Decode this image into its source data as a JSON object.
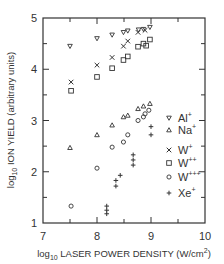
{
  "chart_data": {
    "type": "scatter",
    "title": "",
    "xlabel": "log10 LASER POWER DENSITY (W/cm2)",
    "ylabel": "log10 ION YIELD (arbitrary units)",
    "xlim": [
      7,
      10
    ],
    "ylim": [
      1,
      5
    ],
    "xticks": [
      7,
      8,
      9,
      10
    ],
    "yticks": [
      1,
      2,
      3,
      4,
      5
    ],
    "xtick_labels": [
      "7",
      "8",
      "9",
      "10"
    ],
    "ytick_labels": [
      "1",
      "2",
      "3",
      "4",
      "5"
    ],
    "grid": false,
    "legend_position": "right-inside",
    "series": [
      {
        "name": "Al+",
        "marker": "triangle-down",
        "points": [
          [
            7.5,
            4.45
          ],
          [
            8.0,
            4.6
          ],
          [
            8.28,
            4.67
          ],
          [
            8.49,
            4.72
          ],
          [
            8.57,
            4.75
          ],
          [
            8.77,
            4.77
          ],
          [
            8.86,
            4.78
          ],
          [
            8.98,
            4.82
          ]
        ]
      },
      {
        "name": "Na+",
        "marker": "triangle-up",
        "points": [
          [
            7.5,
            2.47
          ],
          [
            8.0,
            2.72
          ],
          [
            8.28,
            2.91
          ],
          [
            8.49,
            3.07
          ],
          [
            8.57,
            3.1
          ],
          [
            8.76,
            3.23
          ],
          [
            8.86,
            3.28
          ],
          [
            8.98,
            3.33
          ]
        ]
      },
      {
        "name": "W+",
        "marker": "x",
        "points": [
          [
            7.52,
            3.75
          ],
          [
            8.0,
            4.08
          ],
          [
            8.28,
            4.23
          ],
          [
            8.49,
            4.45
          ],
          [
            8.57,
            4.55
          ],
          [
            8.76,
            4.72
          ],
          [
            8.89,
            4.76
          ]
        ]
      },
      {
        "name": "W++",
        "marker": "square",
        "points": [
          [
            7.52,
            3.58
          ],
          [
            8.0,
            3.85
          ],
          [
            8.28,
            4.02
          ],
          [
            8.49,
            4.18
          ],
          [
            8.57,
            4.25
          ],
          [
            8.76,
            4.44
          ],
          [
            8.86,
            4.5
          ],
          [
            8.91,
            4.46
          ],
          [
            8.98,
            4.58
          ]
        ]
      },
      {
        "name": "W+++",
        "marker": "circle",
        "points": [
          [
            7.52,
            1.33
          ],
          [
            8.0,
            2.07
          ],
          [
            8.28,
            2.48
          ],
          [
            8.49,
            2.58
          ],
          [
            8.57,
            2.72
          ],
          [
            8.76,
            3.0
          ],
          [
            8.86,
            3.07
          ],
          [
            8.89,
            3.13
          ],
          [
            8.96,
            3.2
          ]
        ]
      },
      {
        "name": "Xe+",
        "marker": "plus",
        "points": [
          [
            8.18,
            1.33
          ],
          [
            8.18,
            1.25
          ],
          [
            8.18,
            1.18
          ],
          [
            8.35,
            1.83
          ],
          [
            8.35,
            1.72
          ],
          [
            8.43,
            1.93
          ],
          [
            8.67,
            2.33
          ],
          [
            8.67,
            2.23
          ],
          [
            8.67,
            2.13
          ],
          [
            9.0,
            2.72
          ],
          [
            9.0,
            2.88
          ]
        ]
      }
    ]
  },
  "labels": {
    "x_prefix": "log",
    "x_sub": "10",
    "x_main": " LASER POWER DENSITY (W/cm",
    "x_sup": "2",
    "x_end": ")",
    "y_prefix": "log",
    "y_sub": "10",
    "y_main": " ION YIELD (arbitrary units)"
  },
  "legend": [
    {
      "base": "Al",
      "sup": "+",
      "marker": "triangle-down"
    },
    {
      "base": "Na",
      "sup": "+",
      "marker": "triangle-up"
    },
    {
      "base": "W",
      "sup": "+",
      "marker": "x"
    },
    {
      "base": "W",
      "sup": "++",
      "marker": "square"
    },
    {
      "base": "W",
      "sup": "+++",
      "marker": "circle"
    },
    {
      "base": "Xe",
      "sup": "+",
      "marker": "plus"
    }
  ],
  "colors": {
    "ink": "#333333",
    "background": "#ffffff"
  }
}
